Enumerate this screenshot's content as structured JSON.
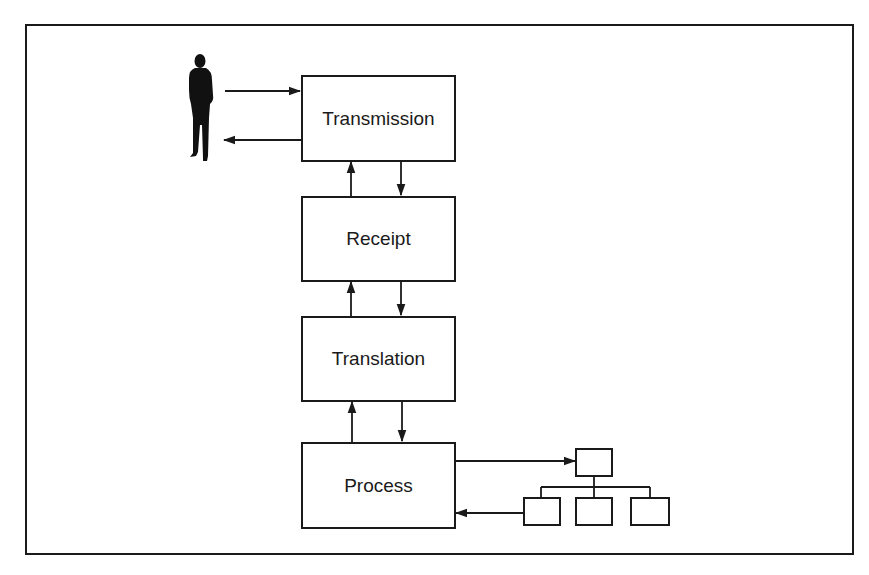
{
  "diagram": {
    "type": "flow",
    "actor": {
      "icon": "person-silhouette-icon"
    },
    "stages": [
      {
        "id": "transmission",
        "label": "Transmission"
      },
      {
        "id": "receipt",
        "label": "Receipt"
      },
      {
        "id": "translation",
        "label": "Translation"
      },
      {
        "id": "process",
        "label": "Process"
      }
    ],
    "hierarchy": {
      "nodes": [
        "root",
        "child-1",
        "child-2",
        "child-3"
      ]
    },
    "edges": [
      {
        "from": "actor",
        "to": "transmission"
      },
      {
        "from": "transmission",
        "to": "actor"
      },
      {
        "from": "receipt",
        "to": "transmission"
      },
      {
        "from": "transmission",
        "to": "receipt"
      },
      {
        "from": "translation",
        "to": "receipt"
      },
      {
        "from": "receipt",
        "to": "translation"
      },
      {
        "from": "process",
        "to": "translation"
      },
      {
        "from": "translation",
        "to": "process"
      },
      {
        "from": "process",
        "to": "hierarchy-root"
      },
      {
        "from": "hierarchy-child-1",
        "to": "process"
      }
    ],
    "colors": {
      "line": "#1a1a1a",
      "background": "#ffffff"
    }
  }
}
